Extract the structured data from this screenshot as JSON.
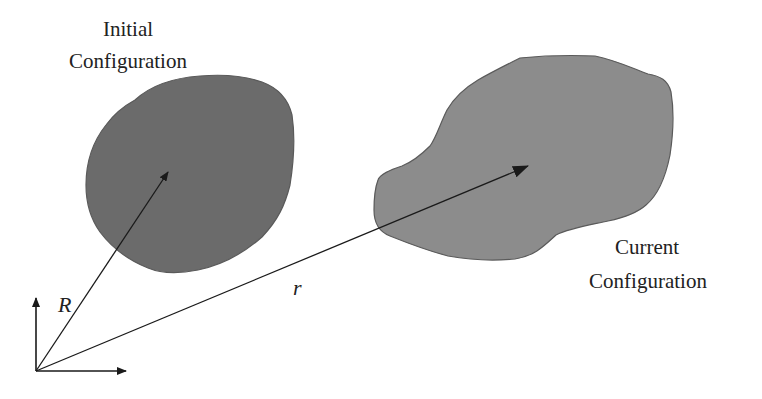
{
  "diagram": {
    "type": "continuum-mechanics-configurations",
    "labels": {
      "initial_line1": "Initial",
      "initial_line2": "Configuration",
      "current_line1": "Current",
      "current_line2": "Configuration",
      "position_initial": "R",
      "position_current": "r"
    },
    "colors": {
      "background": "#ffffff",
      "initial_body": "#6b6b6b",
      "current_body": "#8c8c8c",
      "body_outline": "#5a5a5a",
      "arrows": "#1a1a1a",
      "text": "#222222"
    },
    "nodes": [
      {
        "id": "initial-body",
        "label": "Initial Configuration"
      },
      {
        "id": "current-body",
        "label": "Current Configuration"
      },
      {
        "id": "origin",
        "label": ""
      }
    ],
    "edges": [
      {
        "from": "origin",
        "to": "initial-body",
        "label": "R"
      },
      {
        "from": "origin",
        "to": "current-body",
        "label": "r"
      }
    ]
  }
}
